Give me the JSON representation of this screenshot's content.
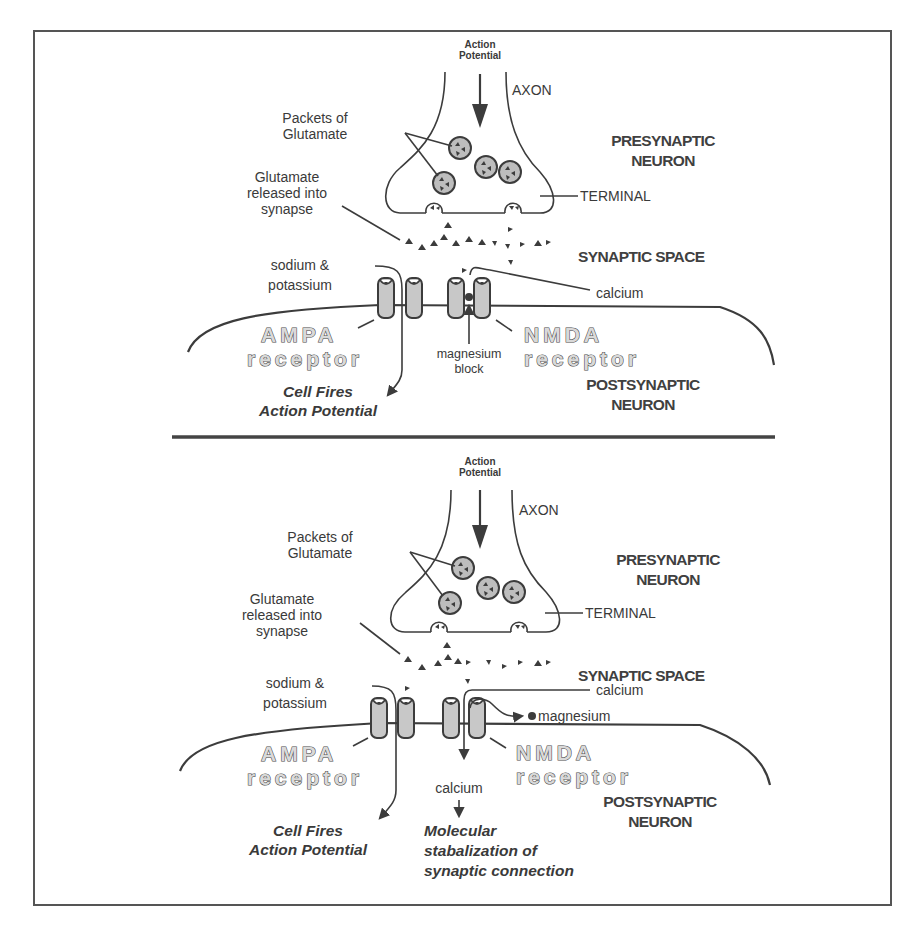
{
  "figure": {
    "border_color": "#555555",
    "divider_color": "#444444",
    "ink_color": "#3c3c3c"
  },
  "panels": [
    {
      "id": "top",
      "action_potential_line1": "Action",
      "action_potential_line2": "Potential",
      "axon": "AXON",
      "packets_line1": "Packets of",
      "packets_line2": "Glutamate",
      "presynaptic_line1": "PRESYNAPTIC",
      "presynaptic_line2": "NEURON",
      "glutamate_released_line1": "Glutamate",
      "glutamate_released_line2": "released  into",
      "glutamate_released_line3": "synapse",
      "terminal": "TERMINAL",
      "synaptic_space": "SYNAPTIC SPACE",
      "sodium_line1": "sodium  &",
      "sodium_line2": "potassium",
      "calcium": "calcium",
      "ampa_line1": "AMPA",
      "ampa_line2": "receptor",
      "nmda_line1": "NMDA",
      "nmda_line2": "receptor",
      "magnesium_line1": "magnesium",
      "magnesium_line2": "block",
      "postsynaptic_line1": "POSTSYNAPTIC",
      "postsynaptic_line2": "NEURON",
      "outcome_line1": "Cell Fires",
      "outcome_line2": "Action Potential"
    },
    {
      "id": "bottom",
      "action_potential_line1": "Action",
      "action_potential_line2": "Potential",
      "axon": "AXON",
      "packets_line1": "Packets of",
      "packets_line2": "Glutamate",
      "presynaptic_line1": "PRESYNAPTIC",
      "presynaptic_line2": "NEURON",
      "glutamate_released_line1": "Glutamate",
      "glutamate_released_line2": "released  into",
      "glutamate_released_line3": "synapse",
      "terminal": "TERMINAL",
      "synaptic_space": "SYNAPTIC SPACE",
      "sodium_line1": "sodium  &",
      "sodium_line2": "potassium",
      "calcium_in": "calcium",
      "magnesium": "magnesium",
      "ampa_line1": "AMPA",
      "ampa_line2": "receptor",
      "nmda_line1": "NMDA",
      "nmda_line2": "receptor",
      "calcium_inside": "calcium",
      "postsynaptic_line1": "POSTSYNAPTIC",
      "postsynaptic_line2": "NEURON",
      "outcome_line1": "Cell Fires",
      "outcome_line2": "Action Potential",
      "molecular_line1": "Molecular",
      "molecular_line2": "stabalization of",
      "molecular_line3": "synaptic connection"
    }
  ]
}
